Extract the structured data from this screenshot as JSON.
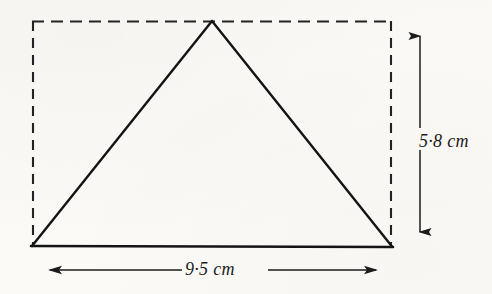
{
  "figure": {
    "type": "geometry-diagram",
    "background_color": "#fbfaf7",
    "ink_color": "#1b1b1b",
    "labels": {
      "height": "5·8 cm",
      "width": "9·5 cm"
    },
    "measurements": {
      "base_value": 9.5,
      "base_unit": "cm",
      "height_value": 5.8,
      "height_unit": "cm"
    },
    "geometry": {
      "rectangle": {
        "style": "dashed",
        "left": 32,
        "top": 21,
        "right": 392,
        "bottom": 246
      },
      "triangle": {
        "style": "solid",
        "apex": [
          212,
          21
        ],
        "base_left": [
          32,
          246
        ],
        "base_right": [
          392,
          247
        ]
      },
      "height_dimension": {
        "orientation": "vertical",
        "x": 420,
        "y_top": 22,
        "y_bottom": 246,
        "arrowheads": "both"
      },
      "width_dimension": {
        "orientation": "horizontal",
        "y": 270,
        "x_left": 36,
        "x_right": 390,
        "arrowheads": "both"
      }
    }
  }
}
